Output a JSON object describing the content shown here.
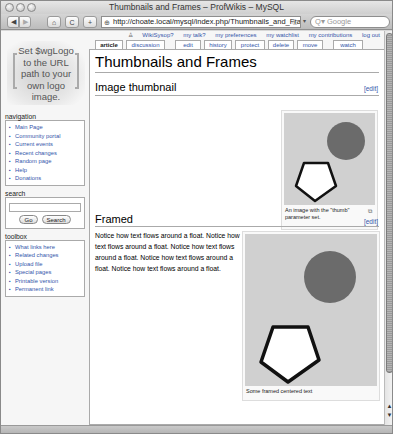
{
  "window": {
    "title": "Thumbnails and Frames – ProfWikis – MySQL"
  },
  "toolbar": {
    "back_icon": "◀",
    "forward_icon": "▶",
    "home_icon": "⌂",
    "reload_icon": "C",
    "add_icon": "+",
    "url": "http://choate.local/mysql/index.php/Thumbnails_and_Fram",
    "search_placeholder": "Q▾ Google"
  },
  "personal_links": [
    {
      "label": "WikiSysop?"
    },
    {
      "label": "my talk?"
    },
    {
      "label": "my preferences"
    },
    {
      "label": "my watchlist"
    },
    {
      "label": "my contributions"
    },
    {
      "label": "log out"
    }
  ],
  "logo": {
    "text_lines": [
      "Set $wgLogo",
      "to the URL",
      "path to your",
      "own logo",
      "image."
    ]
  },
  "tabs": [
    {
      "label": "article",
      "selected": true
    },
    {
      "label": "discussion"
    },
    {
      "label": "edit"
    },
    {
      "label": "history"
    },
    {
      "label": "protect"
    },
    {
      "label": "delete"
    },
    {
      "label": "move"
    },
    {
      "label": "watch"
    }
  ],
  "sidebar": {
    "navigation": {
      "heading": "navigation",
      "items": [
        "Main Page",
        "Community portal",
        "Current events",
        "Recent changes",
        "Random page",
        "Help",
        "Donations"
      ]
    },
    "search": {
      "heading": "search",
      "go_label": "Go",
      "search_label": "Search"
    },
    "toolbox": {
      "heading": "toolbox",
      "items": [
        "What links here",
        "Related changes",
        "Upload file",
        "Special pages",
        "Printable version",
        "Permanent link"
      ]
    }
  },
  "main": {
    "page_title": "Thumbnails and Frames",
    "sections": [
      {
        "heading": "Image thumbnail",
        "edit_label": "[edit]",
        "caption": "An image with the \"thumb\" parameter set.",
        "magnify_icon": "⧉"
      },
      {
        "heading": "Framed",
        "edit_label": "[edit]",
        "body": "Notice how text flows around a float. Notice how text flows around a float. Notice how text flows around a float. Notice how text flows around a float. Notice how text flows around a float.",
        "caption": "Some framed centered text"
      }
    ]
  },
  "colors": {
    "link": "#3355aa",
    "circle": "#6b6b6b",
    "image_bg": "#cfcfcf"
  }
}
